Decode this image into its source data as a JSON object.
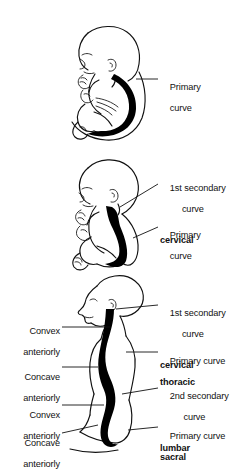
{
  "figure": {
    "background_color": "#ffffff",
    "ink_color": "#111111",
    "spine_color": "#000000"
  },
  "panels": [
    {
      "id": "fetus",
      "subject": "fetus-in-utero",
      "labels": [
        {
          "id": "primary-curve",
          "side": "right",
          "lines": [
            {
              "text": "Primary",
              "align": "left",
              "bold": false
            },
            {
              "text": "curve",
              "align": "left",
              "bold": false
            }
          ]
        }
      ]
    },
    {
      "id": "infant",
      "subject": "seated-infant",
      "labels": [
        {
          "id": "first-secondary-curve-cervical",
          "side": "right",
          "lines": [
            {
              "text": "1st secondary",
              "align": "left",
              "bold": false
            },
            {
              "text": "curve",
              "align": "center",
              "bold": false
            },
            {
              "text": "cervical",
              "align": "left",
              "bold": true
            }
          ]
        },
        {
          "id": "primary-curve",
          "side": "right",
          "lines": [
            {
              "text": "Primary",
              "align": "left",
              "bold": false
            },
            {
              "text": "curve",
              "align": "left",
              "bold": false
            }
          ]
        }
      ]
    },
    {
      "id": "adult",
      "subject": "standing-child-profile",
      "labels": [
        {
          "id": "convex-anteriorly-cervical",
          "side": "left",
          "lines": [
            {
              "text": "Convex",
              "align": "right",
              "bold": false
            },
            {
              "text": "anteriorly",
              "align": "right",
              "bold": false
            }
          ]
        },
        {
          "id": "concave-anteriorly-thoracic",
          "side": "left",
          "lines": [
            {
              "text": "Concave",
              "align": "right",
              "bold": false
            },
            {
              "text": "anteriorly",
              "align": "right",
              "bold": false
            }
          ]
        },
        {
          "id": "convex-anteriorly-lumbar",
          "side": "left",
          "lines": [
            {
              "text": "Convex",
              "align": "right",
              "bold": false
            },
            {
              "text": "anteriorly",
              "align": "right",
              "bold": false
            }
          ]
        },
        {
          "id": "concave-anteriorly-sacral",
          "side": "left",
          "lines": [
            {
              "text": "Concave",
              "align": "right",
              "bold": false
            },
            {
              "text": "anteriorly",
              "align": "right",
              "bold": false
            }
          ]
        },
        {
          "id": "first-secondary-curve-cervical",
          "side": "right",
          "lines": [
            {
              "text": "1st secondary",
              "align": "left",
              "bold": false
            },
            {
              "text": "curve",
              "align": "center",
              "bold": false
            },
            {
              "text": "cervical",
              "align": "left",
              "bold": true
            }
          ]
        },
        {
          "id": "primary-curve-thoracic",
          "side": "right",
          "lines": [
            {
              "text": "Primary curve",
              "align": "left",
              "bold": false
            },
            {
              "text": "thoracic",
              "align": "left",
              "bold": true
            }
          ]
        },
        {
          "id": "second-secondary-curve-lumbar",
          "side": "right",
          "lines": [
            {
              "text": "2nd secondary",
              "align": "left",
              "bold": false
            },
            {
              "text": "curve",
              "align": "center",
              "bold": false
            },
            {
              "text": "lumbar",
              "align": "left",
              "bold": true
            }
          ]
        },
        {
          "id": "primary-curve-sacral",
          "side": "right",
          "lines": [
            {
              "text": "Primary curve",
              "align": "left",
              "bold": false
            },
            {
              "text": "sacral",
              "align": "left",
              "bold": true
            }
          ]
        }
      ]
    }
  ],
  "label_text": {
    "p1_primary_1": "Primary",
    "p1_primary_2": "curve",
    "p2_sec_1": "1st secondary",
    "p2_sec_2": "curve",
    "p2_sec_3": "cervical",
    "p2_primary_1": "Primary",
    "p2_primary_2": "curve",
    "p3_l1_1": "Convex",
    "p3_l1_2": "anteriorly",
    "p3_l2_1": "Concave",
    "p3_l2_2": "anteriorly",
    "p3_l3_1": "Convex",
    "p3_l3_2": "anteriorly",
    "p3_l4_1": "Concave",
    "p3_l4_2": "anteriorly",
    "p3_r1_1": "1st secondary",
    "p3_r1_2": "curve",
    "p3_r1_3": "cervical",
    "p3_r2_1": "Primary curve",
    "p3_r2_2": "thoracic",
    "p3_r3_1": "2nd secondary",
    "p3_r3_2": "curve",
    "p3_r3_3": "lumbar",
    "p3_r4_1": "Primary curve",
    "p3_r4_2": "sacral"
  }
}
